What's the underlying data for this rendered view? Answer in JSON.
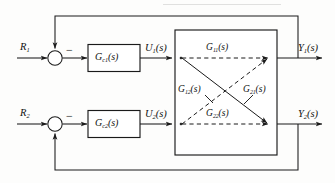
{
  "diagram": {
    "type": "control-block-diagram",
    "colors": {
      "line": "#1a1a1a",
      "background": "#fdfdfc",
      "dashed": "#1a1a1a"
    },
    "inputs": [
      {
        "id": "r1",
        "label_main": "R",
        "label_sub": "1",
        "label_full": "R₁"
      },
      {
        "id": "r2",
        "label_main": "R",
        "label_sub": "2",
        "label_full": "R₂"
      }
    ],
    "summing_junctions": [
      {
        "id": "sum1",
        "sign_positive": "+",
        "sign_negative": "−",
        "negative_symbol": "−",
        "feedback_from": "Y1"
      },
      {
        "id": "sum2",
        "sign_positive": "+",
        "sign_negative": "−",
        "negative_symbol": "−",
        "feedback_from": "Y2"
      }
    ],
    "controllers": [
      {
        "id": "gc1",
        "main": "G",
        "sub": "c1",
        "arg": "(s)",
        "label_full": "G_c1(s)"
      },
      {
        "id": "gc2",
        "main": "G",
        "sub": "c2",
        "arg": "(s)",
        "label_full": "G_c2(s)"
      }
    ],
    "control_signals": [
      {
        "id": "u1",
        "main": "U",
        "sub": "1",
        "arg": "(s)",
        "label_full": "U₁(s)"
      },
      {
        "id": "u2",
        "main": "U",
        "sub": "2",
        "arg": "(s)",
        "label_full": "U₂(s)"
      }
    ],
    "plant": {
      "name": "plant-box",
      "transfer_functions": [
        {
          "id": "g11",
          "main": "G",
          "sub": "11",
          "arg": "(s)",
          "label_full": "G₁₁(s)",
          "path": "u1-to-y1",
          "style": "dashed",
          "position": "top-horizontal"
        },
        {
          "id": "g12",
          "main": "G",
          "sub": "12",
          "arg": "(s)",
          "label_full": "G₁₂(s)",
          "path": "u2-to-y1",
          "style": "dashed",
          "position": "diagonal-up"
        },
        {
          "id": "g21",
          "main": "G",
          "sub": "21",
          "arg": "(s)",
          "label_full": "G₂₁(s)",
          "path": "u1-to-y2",
          "style": "solid",
          "position": "diagonal-down"
        },
        {
          "id": "g22",
          "main": "G",
          "sub": "22",
          "arg": "(s)",
          "label_full": "G₂₂(s)",
          "path": "u2-to-y2",
          "style": "dashed",
          "position": "bottom-horizontal"
        }
      ]
    },
    "outputs": [
      {
        "id": "y1",
        "main": "Y",
        "sub": "1",
        "arg": "(s)",
        "label_full": "Y₁(s)"
      },
      {
        "id": "y2",
        "main": "Y",
        "sub": "2",
        "arg": "(s)",
        "label_full": "Y₂(s)"
      }
    ],
    "feedback_paths": [
      {
        "id": "fb1",
        "from": "y1",
        "to": "sum1",
        "route": "top",
        "sign": "−"
      },
      {
        "id": "fb2",
        "from": "y2",
        "to": "sum2",
        "route": "bottom",
        "sign": "−"
      }
    ]
  }
}
